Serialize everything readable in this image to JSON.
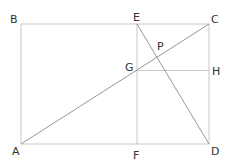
{
  "diagram": {
    "type": "geometry",
    "points": {
      "A": {
        "label": "A",
        "x": 21,
        "y": 144
      },
      "B": {
        "label": "B",
        "x": 21,
        "y": 24
      },
      "C": {
        "label": "C",
        "x": 209,
        "y": 24
      },
      "D": {
        "label": "D",
        "x": 209,
        "y": 144
      },
      "E": {
        "label": "E",
        "x": 137,
        "y": 24
      },
      "F": {
        "label": "F",
        "x": 137,
        "y": 144
      },
      "G": {
        "label": "G",
        "x": 137,
        "y": 70
      },
      "H": {
        "label": "H",
        "x": 209,
        "y": 70
      },
      "P": {
        "label": "P",
        "x": 157,
        "y": 57
      }
    },
    "segments": [
      "AB",
      "BC",
      "CD",
      "DA",
      "AC",
      "EF",
      "GH",
      "ED"
    ]
  }
}
